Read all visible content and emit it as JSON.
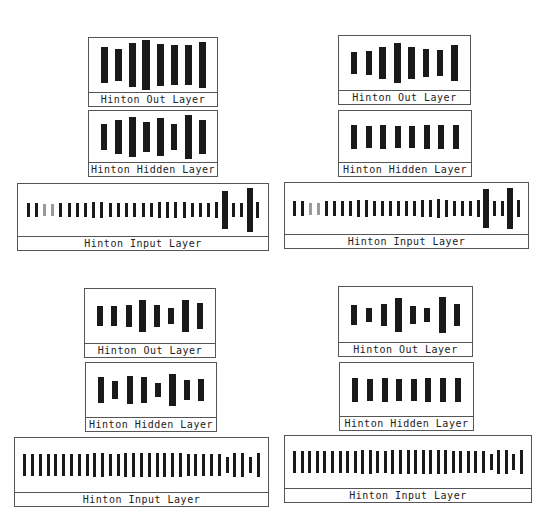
{
  "colors": {
    "bar": "#1a1a1a",
    "bar_light": "#9a9a9a",
    "border": "#555555",
    "background": "#ffffff"
  },
  "panels": [
    {
      "name": "top-left",
      "out": {
        "label": "Hinton Out Layer",
        "box": [
          88,
          37,
          130,
          70
        ],
        "bars": [
          36,
          32,
          44,
          54,
          42,
          40,
          40,
          46
        ]
      },
      "hidden": {
        "label": "Hinton Hidden Layer",
        "box": [
          88,
          110,
          130,
          67
        ],
        "bars": [
          26,
          34,
          40,
          30,
          38,
          26,
          44,
          34
        ]
      },
      "input": {
        "label": "Hinton Input Layer",
        "box": [
          17,
          183,
          252,
          68
        ],
        "bars": [
          12,
          12,
          10,
          10,
          12,
          12,
          12,
          12,
          14,
          14,
          12,
          12,
          12,
          12,
          12,
          12,
          14,
          14,
          14,
          14,
          12,
          12,
          12,
          14,
          32,
          12,
          12,
          36,
          14
        ],
        "light": [
          2,
          3
        ]
      }
    },
    {
      "name": "top-right",
      "out": {
        "label": "Hinton Out Layer",
        "box": [
          338,
          35,
          133,
          70
        ],
        "bars": [
          22,
          24,
          32,
          40,
          32,
          28,
          26,
          36
        ]
      },
      "hidden": {
        "label": "Hinton Hidden Layer",
        "box": [
          338,
          110,
          134,
          67
        ],
        "bars": [
          24,
          22,
          24,
          22,
          22,
          24,
          24,
          24
        ]
      },
      "input": {
        "label": "Hinton Input Layer",
        "box": [
          284,
          182,
          245,
          67
        ],
        "bars": [
          12,
          12,
          10,
          10,
          12,
          12,
          12,
          12,
          14,
          14,
          12,
          12,
          12,
          12,
          12,
          12,
          14,
          14,
          16,
          14,
          12,
          12,
          12,
          14,
          32,
          12,
          12,
          34,
          14
        ],
        "light": [
          2,
          3
        ]
      }
    },
    {
      "name": "bottom-left",
      "out": {
        "label": "Hinton Out Layer",
        "box": [
          84,
          288,
          132,
          70
        ],
        "bars": [
          20,
          20,
          22,
          32,
          22,
          16,
          32,
          26
        ]
      },
      "hidden": {
        "label": "Hinton Hidden Layer",
        "box": [
          85,
          362,
          132,
          70
        ],
        "bars": [
          26,
          18,
          28,
          26,
          14,
          32,
          20,
          22
        ]
      },
      "input": {
        "label": "Hinton Input Layer",
        "box": [
          14,
          437,
          255,
          70
        ],
        "bars": [
          18,
          18,
          18,
          18,
          18,
          18,
          18,
          18,
          18,
          20,
          20,
          18,
          18,
          20,
          20,
          20,
          20,
          20,
          20,
          20,
          20,
          18,
          18,
          18,
          18,
          18,
          14,
          20,
          20,
          14,
          20
        ],
        "light": []
      }
    },
    {
      "name": "bottom-right",
      "out": {
        "label": "Hinton Out Layer",
        "box": [
          338,
          286,
          135,
          71
        ],
        "bars": [
          20,
          14,
          22,
          34,
          18,
          14,
          36,
          22
        ]
      },
      "hidden": {
        "label": "Hinton Hidden Layer",
        "box": [
          339,
          362,
          135,
          69
        ],
        "bars": [
          24,
          22,
          24,
          22,
          22,
          24,
          24,
          24
        ]
      },
      "input": {
        "label": "Hinton Input Layer",
        "box": [
          284,
          435,
          248,
          68
        ],
        "bars": [
          18,
          18,
          18,
          18,
          18,
          18,
          18,
          18,
          18,
          20,
          20,
          18,
          18,
          20,
          20,
          20,
          20,
          20,
          20,
          20,
          20,
          18,
          18,
          18,
          18,
          18,
          14,
          20,
          20,
          14,
          20
        ],
        "light": []
      }
    }
  ]
}
